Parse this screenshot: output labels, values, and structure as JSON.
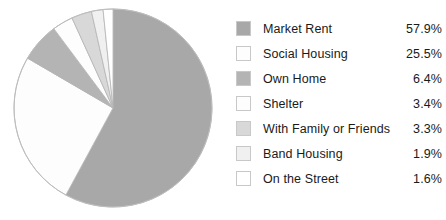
{
  "chart_data": {
    "type": "pie",
    "title": "",
    "subtitle": "",
    "xlabel": "",
    "ylabel": "",
    "legend_position": "right",
    "grid": false,
    "start_angle_deg": 0,
    "direction": "clockwise",
    "units": "percent",
    "categories": [
      "Market Rent",
      "Social Housing",
      "Own Home",
      "Shelter",
      "With Family or Friends",
      "Band Housing",
      "On the Street"
    ],
    "values": [
      57.9,
      25.5,
      6.4,
      3.4,
      3.3,
      1.9,
      1.6
    ],
    "value_labels": [
      "57.9%",
      "25.5%",
      "6.4%",
      "3.4%",
      "3.3%",
      "1.9%",
      "1.6%"
    ],
    "colors": [
      "#a8a8a8",
      "#fdfdfd",
      "#b4b4b4",
      "#fdfdfd",
      "#d8d8d8",
      "#f0f0f0",
      "#ffffff"
    ]
  },
  "legend": {
    "items": [
      {
        "label": "Market Rent",
        "value": "57.9%",
        "color": "#a8a8a8",
        "swatch_name": "legend-swatch-market-rent"
      },
      {
        "label": "Social Housing",
        "value": "25.5%",
        "color": "#fdfdfd",
        "swatch_name": "legend-swatch-social-housing"
      },
      {
        "label": "Own Home",
        "value": "6.4%",
        "color": "#b4b4b4",
        "swatch_name": "legend-swatch-own-home"
      },
      {
        "label": "Shelter",
        "value": "3.4%",
        "color": "#fdfdfd",
        "swatch_name": "legend-swatch-shelter"
      },
      {
        "label": "With Family or Friends",
        "value": "3.3%",
        "color": "#d8d8d8",
        "swatch_name": "legend-swatch-with-family-or-friends"
      },
      {
        "label": "Band Housing",
        "value": "1.9%",
        "color": "#f0f0f0",
        "swatch_name": "legend-swatch-band-housing"
      },
      {
        "label": "On the Street",
        "value": "1.6%",
        "color": "#ffffff",
        "swatch_name": "legend-swatch-on-the-street"
      }
    ]
  }
}
